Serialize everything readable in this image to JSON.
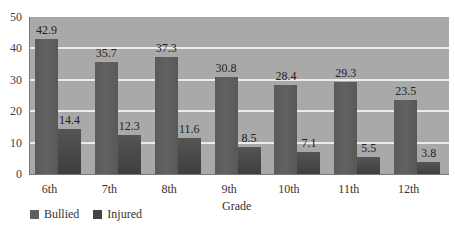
{
  "chart_data": {
    "type": "bar",
    "title": "",
    "xlabel": "Grade",
    "ylabel": "",
    "ylim": [
      0,
      50
    ],
    "yticks": [
      0,
      10,
      20,
      30,
      40,
      50
    ],
    "grid": true,
    "legend_position": "bottom-left",
    "categories": [
      "6th",
      "7th",
      "8th",
      "9th",
      "10th",
      "11th",
      "12th"
    ],
    "series": [
      {
        "name": "Bullied",
        "color": "#5e5e5e",
        "values": [
          42.9,
          35.7,
          37.3,
          30.8,
          28.4,
          29.3,
          23.5
        ]
      },
      {
        "name": "Injured",
        "color": "#474747",
        "values": [
          14.4,
          12.3,
          11.6,
          8.5,
          7.1,
          5.5,
          3.8
        ]
      }
    ]
  },
  "labels": {
    "xlabel": "Grade",
    "legend_bullied": "Bullied",
    "legend_injured": "Injured"
  }
}
